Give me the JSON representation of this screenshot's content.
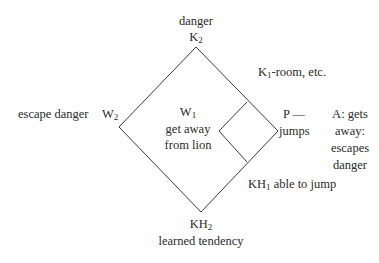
{
  "diagram": {
    "top": {
      "caption": "danger",
      "node": "K",
      "node_sub": "2"
    },
    "left": {
      "caption": "escape danger",
      "node": "W",
      "node_sub": "2"
    },
    "center": {
      "node": "W",
      "node_sub": "1",
      "line1": "get away",
      "line2": "from lion"
    },
    "upper_right": {
      "node": "K",
      "node_sub": "1",
      "text": "-room, etc."
    },
    "right": {
      "line1": "P —",
      "line2": "jumps"
    },
    "outcome": {
      "line1": "A: gets",
      "line2": "away:",
      "line3": "escapes",
      "line4": "danger"
    },
    "lower_right": {
      "node": "KH",
      "node_sub": "1",
      "text": " able to jump"
    },
    "bottom": {
      "node": "KH",
      "node_sub": "2",
      "caption": "learned tendency"
    },
    "colors": {
      "line": "#3a3a3a",
      "text": "#2a2a2a",
      "background": "#ffffff"
    }
  }
}
